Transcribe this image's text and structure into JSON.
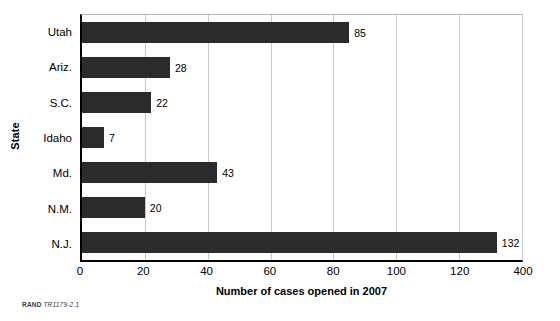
{
  "chart_data": {
    "type": "bar",
    "orientation": "horizontal",
    "title": "",
    "xlabel": "Number of cases opened in 2007",
    "ylabel": "State",
    "categories": [
      "Utah",
      "Ariz.",
      "S.C.",
      "Idaho",
      "Md.",
      "N.M.",
      "N.J."
    ],
    "values": [
      85,
      28,
      22,
      7,
      43,
      20,
      132
    ],
    "value_labels": [
      "85",
      "28",
      "22",
      "7",
      "43",
      "20",
      "132"
    ],
    "xticks": [
      0,
      20,
      40,
      60,
      80,
      100,
      120,
      140
    ],
    "xtick_labels": [
      "0",
      "20",
      "40",
      "60",
      "80",
      "100",
      "120",
      "400"
    ],
    "xlim": [
      0,
      140
    ],
    "grid": "vertical",
    "legend": "none",
    "bar_color": "#2b2b2b",
    "gridline_color": "#c9c9c9",
    "axis_color": "#000000",
    "background_color": "#ffffff"
  },
  "credit": {
    "brand": "RAND",
    "id": "TR1179-2.1"
  }
}
